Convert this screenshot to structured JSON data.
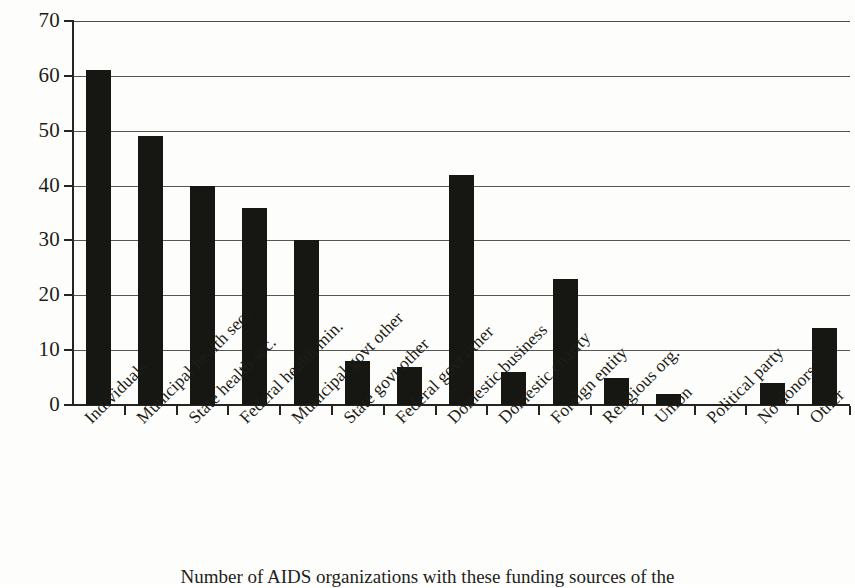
{
  "figure": {
    "caption": "Number of AIDS organizations with these funding sources of the"
  },
  "chart_data": {
    "type": "bar",
    "title": "",
    "subtitle": "",
    "xlabel": "",
    "ylabel": "",
    "ylim": [
      0,
      70
    ],
    "ytick_step": 10,
    "ytick_labels": [
      "0",
      "10",
      "20",
      "30",
      "40",
      "50",
      "60",
      "70"
    ],
    "grid": true,
    "legend": false,
    "bar_color": "#161612",
    "categories": [
      "Individuals",
      "Municipal health sec.",
      "State health sec.",
      "Federal health min.",
      "Municipal govt other",
      "State govt other",
      "Federal govt other",
      "Domestic business",
      "Domestic charity",
      "Foreign entity",
      "Religious org.",
      "Union",
      "Political party",
      "No donors",
      "Other"
    ],
    "values": [
      61,
      49,
      40,
      36,
      30,
      8,
      7,
      42,
      6,
      23,
      5,
      2,
      0,
      4,
      14
    ]
  }
}
